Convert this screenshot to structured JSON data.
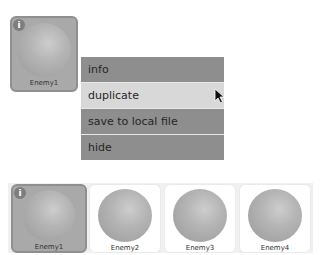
{
  "popup_card": {
    "label": "Enemy1",
    "info_icon": "i"
  },
  "context_menu": {
    "items": [
      {
        "label": "info",
        "hovered": false
      },
      {
        "label": "duplicate",
        "hovered": true
      },
      {
        "label": "save to local file",
        "hovered": false
      },
      {
        "label": "hide",
        "hovered": false
      }
    ]
  },
  "sprite_row": {
    "items": [
      {
        "label": "Enemy1",
        "selected": true,
        "info_icon": "i"
      },
      {
        "label": "Enemy2",
        "selected": false
      },
      {
        "label": "Enemy3",
        "selected": false
      },
      {
        "label": "Enemy4",
        "selected": false
      }
    ]
  },
  "colors": {
    "menu_item": "#8e8e8e",
    "menu_hover": "#d8d8d8",
    "selected_card": "#a9a9a9"
  }
}
